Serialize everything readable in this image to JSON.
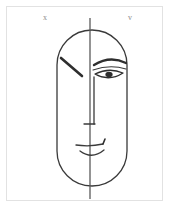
{
  "artwork": {
    "title": "Symmetry study: half-abstract, half-rendered face",
    "background_color": "#ffffff",
    "frame_color": "#e2e2e2",
    "ink_color": "#3a3a3a",
    "width": 171,
    "height": 209
  },
  "labels": {
    "left_mark": "x",
    "right_mark": "v",
    "left_mark_name": "x-mark",
    "right_mark_name": "v-mark"
  },
  "icons": {
    "frame": "rectangle-frame-icon",
    "head": "head-oval-icon",
    "axis": "vertical-center-line-icon",
    "left_brow": "diagonal-slash-icon",
    "right_brow": "eyebrow-arc-icon",
    "eye": "eye-almond-icon",
    "pupil": "pupil-icon",
    "eye_crease": "eye-crease-icon",
    "nose": "nose-line-icon",
    "nose_base": "nose-base-icon",
    "mouth_upper": "upper-lip-icon",
    "mouth_lower": "lower-lip-icon",
    "mouth_corner": "mouth-corner-tick-icon"
  },
  "geometry": {
    "head": {
      "cx": 92,
      "cy": 108,
      "rx": 35,
      "ry": 78,
      "top": 30,
      "bottom": 186,
      "left": 57,
      "right": 127,
      "corner_radius": 35,
      "stroke_width": 1.3
    },
    "axis": {
      "x": 90,
      "y_top": 18,
      "y_bottom": 199,
      "stroke_width": 1.3
    },
    "left_brow": {
      "x1": 61,
      "y1": 58,
      "x2": 82,
      "y2": 76,
      "stroke_width": 2.4
    },
    "right_brow": {
      "x1": 94,
      "y1": 64,
      "cx": 110,
      "cy": 56,
      "x2": 126,
      "y2": 63,
      "stroke_width": 2.2
    },
    "eye": {
      "x1": 94,
      "y1": 72,
      "x2": 124,
      "y2": 71,
      "cx": 109,
      "cy": 78,
      "stroke_width": 1.3
    },
    "pupil": {
      "cx": 109,
      "cy": 74,
      "rx": 3.4,
      "ry": 2.6
    },
    "nose": {
      "x": 94,
      "y_top": 76,
      "y_bottom": 124,
      "base_x1": 85,
      "base_x2": 97,
      "base_y": 124,
      "stroke_width": 1.3
    },
    "mouth": {
      "upper_x1": 76,
      "upper_x2": 105,
      "upper_y": 145,
      "corner_x": 104,
      "corner_y": 141,
      "lower_x1": 80,
      "lower_x2": 104,
      "lower_cy": 156,
      "stroke_width": 1.3
    }
  }
}
